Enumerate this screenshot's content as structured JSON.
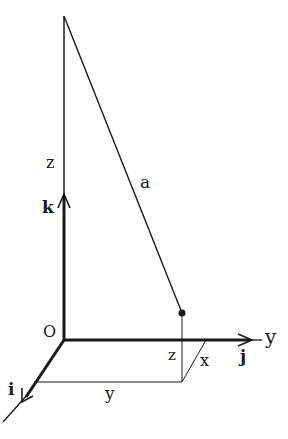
{
  "diagram": {
    "type": "3d-coordinate-vector-diagram",
    "colors": {
      "ink": "#1a1a1a",
      "background": "#ffffff"
    },
    "labels": {
      "origin": "O",
      "z_axis_label": "z",
      "vector_a": "a",
      "unit_k": "k",
      "unit_i": "i",
      "unit_j": "j",
      "y_axis": "y",
      "z_component": "z",
      "x_component": "x",
      "y_component": "y"
    }
  }
}
